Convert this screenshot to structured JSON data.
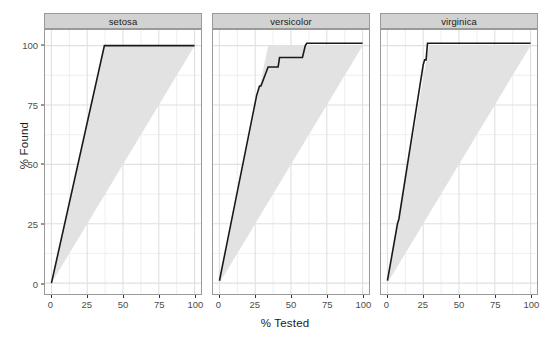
{
  "chart_data": {
    "type": "line",
    "title": "",
    "subtitle": "",
    "xlabel": "% Tested",
    "ylabel": "% Found",
    "xlim": [
      0,
      100
    ],
    "ylim": [
      0,
      102
    ],
    "grid": true,
    "legend_position": "none",
    "facet_variable": "species",
    "x_ticks": [
      0,
      25,
      50,
      75,
      100
    ],
    "x_tick_labels": [
      "0",
      "25",
      "50",
      "75",
      "100"
    ],
    "y_ticks": [
      0,
      25,
      50,
      75,
      100
    ],
    "y_tick_labels": [
      "0",
      "25",
      "50",
      "75",
      "100"
    ],
    "x_minor_ticks": [
      12.5,
      37.5,
      62.5,
      87.5
    ],
    "y_minor_ticks": [
      12.5,
      37.5,
      62.5,
      87.5
    ],
    "series_color": "#1a1a1a",
    "band_color": "#e2e2e2",
    "panel_background": "#ffffff",
    "gridline_color": "#ebebeb",
    "strip_background": "#d2d2d2",
    "panels": [
      {
        "label": "setosa",
        "ideal_x": 37,
        "band": [
          [
            0,
            0
          ],
          [
            37,
            100
          ],
          [
            100,
            100
          ],
          [
            100,
            100
          ],
          [
            0,
            0
          ]
        ],
        "gain_curve": {
          "x": [
            0,
            37,
            50,
            75,
            100
          ],
          "y": [
            0,
            100,
            100,
            100,
            100
          ]
        }
      },
      {
        "label": "versicolor",
        "ideal_x": 34,
        "band": [
          [
            0,
            0
          ],
          [
            34,
            100
          ],
          [
            100,
            100
          ],
          [
            100,
            100
          ],
          [
            0,
            0
          ]
        ],
        "gain_curve": {
          "x": [
            0,
            26,
            28,
            29,
            34,
            36,
            41,
            42,
            52,
            58,
            60,
            61,
            100
          ],
          "y": [
            1,
            79,
            83,
            83,
            91,
            91,
            91,
            95,
            95,
            95,
            100,
            101,
            101
          ]
        }
      },
      {
        "label": "virginica",
        "ideal_x": 29,
        "band": [
          [
            0,
            0
          ],
          [
            29,
            100
          ],
          [
            100,
            100
          ],
          [
            100,
            100
          ],
          [
            0,
            0
          ]
        ],
        "gain_curve": {
          "x": [
            0,
            7,
            8,
            25,
            26,
            27,
            28,
            29,
            100
          ],
          "y": [
            1,
            25,
            27,
            92,
            94,
            94,
            101,
            101,
            101
          ]
        }
      }
    ]
  },
  "axes": {
    "y_title": "% Found",
    "x_title": "% Tested",
    "y_tick_labels": [
      "100",
      "75",
      "50",
      "25",
      "0"
    ],
    "x_tick_labels": [
      "0",
      "25",
      "50",
      "75",
      "100"
    ]
  },
  "strips": {
    "setosa": "setosa",
    "versicolor": "versicolor",
    "virginica": "virginica"
  }
}
